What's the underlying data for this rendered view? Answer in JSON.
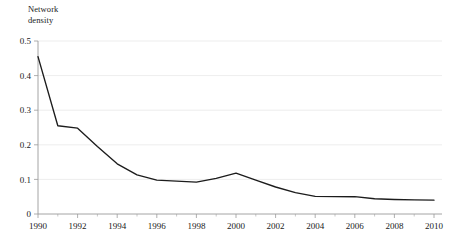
{
  "chart_data": {
    "type": "line",
    "title": "",
    "ylabel": "Network\ndensity",
    "ylabel_line1": "Network",
    "ylabel_line2": "density",
    "xlabel": "",
    "ylim": [
      0,
      0.5
    ],
    "xlim": [
      1990,
      2010
    ],
    "grid": true,
    "legend": "none",
    "y_ticks": [
      0,
      0.1,
      0.2,
      0.3,
      0.4,
      0.5
    ],
    "y_tick_labels": [
      "0",
      "0.1",
      "0.2",
      "0.3",
      "0.4",
      "0.5"
    ],
    "x_ticks": [
      1990,
      1992,
      1994,
      1996,
      1998,
      2000,
      2002,
      2004,
      2006,
      2008,
      2010
    ],
    "x_tick_labels": [
      "1990",
      "1992",
      "1994",
      "1996",
      "1998",
      "2000",
      "2002",
      "2004",
      "2006",
      "2008",
      "2010"
    ],
    "x_minor_ticks": [
      1991,
      1993,
      1995,
      1997,
      1999,
      2001,
      2003,
      2005,
      2007,
      2009
    ],
    "x": [
      1990,
      1991,
      1992,
      1993,
      1994,
      1995,
      1996,
      1997,
      1998,
      1999,
      2000,
      2001,
      2002,
      2003,
      2004,
      2005,
      2006,
      2007,
      2008,
      2009,
      2010
    ],
    "values": [
      0.455,
      0.255,
      0.248,
      0.195,
      0.145,
      0.113,
      0.098,
      0.095,
      0.092,
      0.103,
      0.118,
      0.098,
      0.078,
      0.062,
      0.051,
      0.05,
      0.05,
      0.044,
      0.042,
      0.041,
      0.04
    ],
    "series": [
      {
        "name": "Network density",
        "color": "#1c1c1c",
        "values": [
          0.455,
          0.255,
          0.248,
          0.195,
          0.145,
          0.113,
          0.098,
          0.095,
          0.092,
          0.103,
          0.118,
          0.098,
          0.078,
          0.062,
          0.051,
          0.05,
          0.05,
          0.044,
          0.042,
          0.041,
          0.04
        ]
      }
    ],
    "colors": {
      "line": "#1c1c1c",
      "grid": "#e8e8e8",
      "axis": "#9a9a9a",
      "text": "#1a1a1a",
      "background": "#ffffff"
    }
  }
}
